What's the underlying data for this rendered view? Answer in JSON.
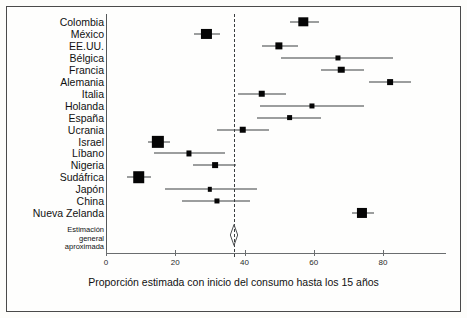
{
  "chart_data": {
    "type": "scatter",
    "subtype": "forest-plot",
    "title": "",
    "xlabel": "Proporción estimada con inicio del consumo hasta los 15 años",
    "ylabel": "",
    "xlim": [
      0,
      90
    ],
    "xticks": [
      0,
      20,
      40,
      60,
      80
    ],
    "xtick_labels": [
      "0",
      "20",
      "40",
      "60",
      "80"
    ],
    "grid": false,
    "legend": "none",
    "reference_line": {
      "value": 37,
      "style": "dashed",
      "label": "Estimación\ngeneral\naproximada"
    },
    "summary": {
      "label": "Estimación general aproximada",
      "value": 37,
      "low": 35.5,
      "high": 38.5,
      "marker": "diamond"
    },
    "categories": [
      "Colombia",
      "México",
      "EE.UU.",
      "Bélgica",
      "Francia",
      "Alemania",
      "Italia",
      "Holanda",
      "España",
      "Ucrania",
      "Israel",
      "Líbano",
      "Nigeria",
      "Sudáfrica",
      "Japón",
      "China",
      "Nueva Zelanda"
    ],
    "points": [
      {
        "label": "Colombia",
        "value": 57.0,
        "low": 53.0,
        "high": 61.5,
        "weight": 10
      },
      {
        "label": "México",
        "value": 29.0,
        "low": 25.5,
        "high": 33.0,
        "weight": 11
      },
      {
        "label": "EE.UU.",
        "value": 50.0,
        "low": 45.0,
        "high": 55.5,
        "weight": 7
      },
      {
        "label": "Bélgica",
        "value": 67.0,
        "low": 50.5,
        "high": 83.0,
        "weight": 4
      },
      {
        "label": "Francia",
        "value": 68.0,
        "low": 62.0,
        "high": 74.5,
        "weight": 6
      },
      {
        "label": "Alemania",
        "value": 82.0,
        "low": 76.0,
        "high": 88.0,
        "weight": 5
      },
      {
        "label": "Italia",
        "value": 45.0,
        "low": 38.0,
        "high": 52.0,
        "weight": 6
      },
      {
        "label": "Holanda",
        "value": 59.5,
        "low": 44.5,
        "high": 74.5,
        "weight": 4
      },
      {
        "label": "España",
        "value": 53.0,
        "low": 43.5,
        "high": 62.0,
        "weight": 5
      },
      {
        "label": "Ucrania",
        "value": 39.5,
        "low": 32.0,
        "high": 47.0,
        "weight": 6
      },
      {
        "label": "Israel",
        "value": 15.0,
        "low": 12.0,
        "high": 18.5,
        "weight": 14
      },
      {
        "label": "Líbano",
        "value": 24.0,
        "low": 14.0,
        "high": 34.5,
        "weight": 4
      },
      {
        "label": "Nigeria",
        "value": 31.5,
        "low": 25.0,
        "high": 37.5,
        "weight": 5
      },
      {
        "label": "Sudáfrica",
        "value": 9.5,
        "low": 6.0,
        "high": 13.0,
        "weight": 13
      },
      {
        "label": "Japón",
        "value": 30.0,
        "low": 17.0,
        "high": 43.5,
        "weight": 3
      },
      {
        "label": "China",
        "value": 32.0,
        "low": 22.0,
        "high": 41.5,
        "weight": 4
      },
      {
        "label": "Nueva Zelanda",
        "value": 74.0,
        "low": 71.0,
        "high": 77.5,
        "weight": 11
      }
    ]
  },
  "axis": {
    "x_title": "Proporción estimada con inicio del consumo hasta los 15 años"
  },
  "footnote": {
    "text": "Estimación\ngeneral\naproximada"
  }
}
